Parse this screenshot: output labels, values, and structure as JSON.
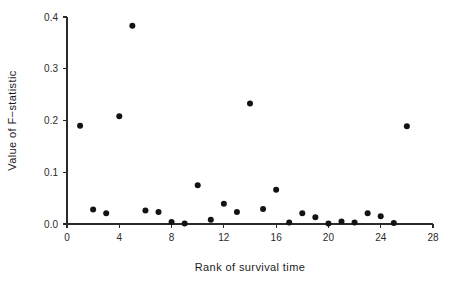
{
  "chart_data": {
    "type": "scatter",
    "title": "",
    "xlabel": "Rank of survival time",
    "ylabel": "Value of F−statistic",
    "xlim": [
      0,
      28
    ],
    "ylim": [
      0.0,
      0.4
    ],
    "grid": false,
    "legend": null,
    "xticks": [
      0,
      4,
      8,
      12,
      16,
      20,
      24,
      28
    ],
    "xticklabels": [
      "0",
      "4",
      "8",
      "12",
      "16",
      "20",
      "24",
      "28"
    ],
    "yticks": [
      0.0,
      0.1,
      0.2,
      0.3,
      0.4
    ],
    "yticklabels": [
      "0.0",
      "0.1",
      "0.2",
      "0.3",
      "0.4"
    ],
    "marker": "filled-circle",
    "marker_color": "#131313",
    "marker_size": 3.0,
    "x": [
      1,
      2,
      3,
      4,
      5,
      6,
      7,
      8,
      9,
      10,
      11,
      12,
      13,
      14,
      15,
      16,
      17,
      18,
      19,
      20,
      21,
      22,
      23,
      24,
      25,
      26
    ],
    "y": [
      0.19,
      0.028,
      0.021,
      0.208,
      0.383,
      0.026,
      0.023,
      0.004,
      0.001,
      0.075,
      0.008,
      0.039,
      0.023,
      0.233,
      0.029,
      0.066,
      0.003,
      0.021,
      0.013,
      0.001,
      0.005,
      0.003,
      0.021,
      0.015,
      0.002,
      0.189
    ],
    "points": [
      {
        "rank": 1,
        "value": 0.19
      },
      {
        "rank": 2,
        "value": 0.028
      },
      {
        "rank": 3,
        "value": 0.021
      },
      {
        "rank": 4,
        "value": 0.208
      },
      {
        "rank": 5,
        "value": 0.383
      },
      {
        "rank": 6,
        "value": 0.026
      },
      {
        "rank": 7,
        "value": 0.023
      },
      {
        "rank": 8,
        "value": 0.004
      },
      {
        "rank": 9,
        "value": 0.001
      },
      {
        "rank": 10,
        "value": 0.075
      },
      {
        "rank": 11,
        "value": 0.008
      },
      {
        "rank": 12,
        "value": 0.039
      },
      {
        "rank": 13,
        "value": 0.023
      },
      {
        "rank": 14,
        "value": 0.233
      },
      {
        "rank": 15,
        "value": 0.029
      },
      {
        "rank": 16,
        "value": 0.066
      },
      {
        "rank": 17,
        "value": 0.003
      },
      {
        "rank": 18,
        "value": 0.021
      },
      {
        "rank": 19,
        "value": 0.013
      },
      {
        "rank": 20,
        "value": 0.001
      },
      {
        "rank": 21,
        "value": 0.005
      },
      {
        "rank": 22,
        "value": 0.003
      },
      {
        "rank": 23,
        "value": 0.021
      },
      {
        "rank": 24,
        "value": 0.015
      },
      {
        "rank": 25,
        "value": 0.002
      },
      {
        "rank": 26,
        "value": 0.189
      }
    ]
  },
  "axes": {
    "axis_color": "#2b2b2b",
    "background": "#ffffff"
  }
}
